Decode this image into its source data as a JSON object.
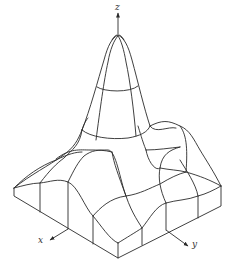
{
  "figure": {
    "axes": {
      "x": {
        "label": "x"
      },
      "y": {
        "label": "y"
      },
      "z": {
        "label": "z"
      }
    },
    "colors": {
      "line": "#2a2a2a",
      "background": "#ffffff"
    }
  }
}
